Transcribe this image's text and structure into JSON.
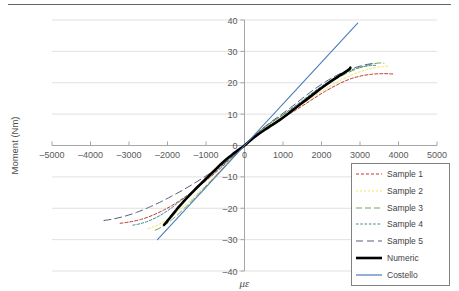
{
  "figure": {
    "has_top_rule": true
  },
  "chart_data": {
    "type": "line",
    "title": "",
    "xlabel": "με",
    "ylabel": "Moment (Nm)",
    "xlim": [
      -5000,
      5000
    ],
    "ylim": [
      -40,
      40
    ],
    "xticks": [
      -5000,
      -4000,
      -3000,
      -2000,
      -1000,
      0,
      1000,
      2000,
      3000,
      4000,
      5000
    ],
    "yticks": [
      40,
      30,
      20,
      10,
      0,
      -10,
      -20,
      -30,
      -40
    ],
    "xtick_labels": [
      "–5000",
      "–4000",
      "–3000",
      "–2000",
      "–1000",
      "0",
      "1000",
      "2000",
      "3000",
      "4000",
      "5000"
    ],
    "ytick_labels": [
      "40",
      "30",
      "20",
      "10",
      "0",
      "–10",
      "–20",
      "–30",
      "–40"
    ],
    "grid": "horizontal",
    "legend_position": "bottom-right",
    "series": [
      {
        "name": "Sample 1",
        "color": "#C0392B",
        "style": "dashed",
        "width": 1,
        "points": [
          [
            -3230,
            -24.8
          ],
          [
            -3000,
            -24.4
          ],
          [
            -2700,
            -23.6
          ],
          [
            -2400,
            -22.3
          ],
          [
            -2100,
            -20.6
          ],
          [
            -1800,
            -18.5
          ],
          [
            -1500,
            -16.0
          ],
          [
            -1200,
            -13.2
          ],
          [
            -900,
            -10.2
          ],
          [
            -600,
            -7.0
          ],
          [
            -300,
            -3.6
          ],
          [
            0,
            0
          ],
          [
            300,
            3.2
          ],
          [
            600,
            6.0
          ],
          [
            900,
            8.2
          ],
          [
            1200,
            10.3
          ],
          [
            1500,
            12.6
          ],
          [
            1800,
            15.0
          ],
          [
            2100,
            17.3
          ],
          [
            2400,
            19.3
          ],
          [
            2700,
            21.0
          ],
          [
            3000,
            22.1
          ],
          [
            3300,
            22.7
          ],
          [
            3600,
            22.9
          ],
          [
            3850,
            22.8
          ]
        ]
      },
      {
        "name": "Sample 2",
        "color": "#F2E55C",
        "style": "dotted",
        "width": 1,
        "points": [
          [
            -2500,
            -26.5
          ],
          [
            -2300,
            -25.6
          ],
          [
            -2100,
            -24.3
          ],
          [
            -1900,
            -22.6
          ],
          [
            -1700,
            -20.6
          ],
          [
            -1500,
            -18.5
          ],
          [
            -1300,
            -16.2
          ],
          [
            -1100,
            -13.9
          ],
          [
            -900,
            -11.4
          ],
          [
            -700,
            -8.9
          ],
          [
            -500,
            -6.3
          ],
          [
            -300,
            -3.7
          ],
          [
            0,
            0
          ],
          [
            300,
            3.4
          ],
          [
            600,
            6.3
          ],
          [
            900,
            8.6
          ],
          [
            1200,
            10.8
          ],
          [
            1500,
            13.2
          ],
          [
            1800,
            15.6
          ],
          [
            2100,
            18.0
          ],
          [
            2400,
            20.2
          ],
          [
            2700,
            22.0
          ],
          [
            3000,
            23.5
          ],
          [
            3300,
            24.6
          ],
          [
            3600,
            25.2
          ],
          [
            3730,
            25.3
          ]
        ]
      },
      {
        "name": "Sample 3",
        "color": "#6AA84F",
        "style": "dashed-long",
        "width": 1,
        "points": [
          [
            -2320,
            -27.0
          ],
          [
            -2150,
            -26.0
          ],
          [
            -1950,
            -24.3
          ],
          [
            -1750,
            -22.2
          ],
          [
            -1550,
            -19.9
          ],
          [
            -1350,
            -17.4
          ],
          [
            -1150,
            -14.9
          ],
          [
            -950,
            -12.3
          ],
          [
            -750,
            -9.7
          ],
          [
            -550,
            -7.1
          ],
          [
            -350,
            -4.5
          ],
          [
            -150,
            -1.9
          ],
          [
            0,
            0
          ],
          [
            250,
            3.0
          ],
          [
            550,
            6.2
          ],
          [
            850,
            8.6
          ],
          [
            1150,
            10.9
          ],
          [
            1450,
            13.4
          ],
          [
            1750,
            16.0
          ],
          [
            2050,
            18.6
          ],
          [
            2350,
            21.0
          ],
          [
            2650,
            23.0
          ],
          [
            2950,
            24.6
          ],
          [
            3250,
            25.8
          ],
          [
            3500,
            26.3
          ],
          [
            3620,
            26.2
          ]
        ]
      },
      {
        "name": "Sample 4",
        "color": "#3E8A95",
        "style": "dotted-dense",
        "width": 1,
        "points": [
          [
            -2900,
            -25.4
          ],
          [
            -2700,
            -24.9
          ],
          [
            -2500,
            -24.1
          ],
          [
            -2300,
            -23.0
          ],
          [
            -2100,
            -21.6
          ],
          [
            -1900,
            -19.9
          ],
          [
            -1700,
            -18.0
          ],
          [
            -1500,
            -16.1
          ],
          [
            -1300,
            -14.0
          ],
          [
            -1100,
            -11.9
          ],
          [
            -900,
            -9.8
          ],
          [
            -700,
            -7.7
          ],
          [
            -500,
            -5.5
          ],
          [
            -300,
            -3.3
          ],
          [
            0,
            0
          ],
          [
            300,
            3.5
          ],
          [
            600,
            6.5
          ],
          [
            900,
            9.0
          ],
          [
            1200,
            11.6
          ],
          [
            1500,
            14.3
          ],
          [
            1800,
            17.1
          ],
          [
            2100,
            19.7
          ],
          [
            2400,
            21.9
          ],
          [
            2700,
            23.7
          ],
          [
            3000,
            24.9
          ],
          [
            3300,
            25.5
          ],
          [
            3450,
            25.5
          ]
        ]
      },
      {
        "name": "Sample 5",
        "color": "#5B5D7A",
        "style": "dashed-wide",
        "width": 1,
        "points": [
          [
            -3650,
            -23.9
          ],
          [
            -3400,
            -23.4
          ],
          [
            -3100,
            -22.5
          ],
          [
            -2800,
            -21.3
          ],
          [
            -2500,
            -19.8
          ],
          [
            -2200,
            -18.1
          ],
          [
            -1900,
            -16.2
          ],
          [
            -1600,
            -14.2
          ],
          [
            -1300,
            -12.0
          ],
          [
            -1000,
            -9.7
          ],
          [
            -700,
            -7.2
          ],
          [
            -400,
            -4.5
          ],
          [
            -150,
            -2.0
          ],
          [
            0,
            0
          ],
          [
            300,
            3.6
          ],
          [
            600,
            6.7
          ],
          [
            900,
            9.4
          ],
          [
            1200,
            12.1
          ],
          [
            1500,
            15.0
          ],
          [
            1800,
            17.8
          ],
          [
            2100,
            20.3
          ],
          [
            2400,
            22.4
          ],
          [
            2700,
            24.1
          ],
          [
            3000,
            25.3
          ],
          [
            3250,
            26.0
          ],
          [
            3400,
            26.2
          ]
        ]
      },
      {
        "name": "Numeric",
        "color": "#000000",
        "style": "solid",
        "width": 2.6,
        "points": [
          [
            -2090,
            -25.3
          ],
          [
            -2000,
            -24.0
          ],
          [
            -1900,
            -22.5
          ],
          [
            -1800,
            -21.0
          ],
          [
            -1700,
            -19.5
          ],
          [
            -1600,
            -18.1
          ],
          [
            -1500,
            -16.8
          ],
          [
            -1400,
            -15.5
          ],
          [
            -1300,
            -14.2
          ],
          [
            -1200,
            -13.0
          ],
          [
            -1100,
            -11.8
          ],
          [
            -1000,
            -10.6
          ],
          [
            -900,
            -9.4
          ],
          [
            -800,
            -8.2
          ],
          [
            -700,
            -7.0
          ],
          [
            -600,
            -5.8
          ],
          [
            -500,
            -4.7
          ],
          [
            -400,
            -3.7
          ],
          [
            -300,
            -2.7
          ],
          [
            -200,
            -1.8
          ],
          [
            -100,
            -0.9
          ],
          [
            0,
            0
          ],
          [
            150,
            1.6
          ],
          [
            350,
            3.5
          ],
          [
            550,
            5.2
          ],
          [
            700,
            6.4
          ],
          [
            900,
            8.0
          ],
          [
            1100,
            9.8
          ],
          [
            1300,
            11.7
          ],
          [
            1500,
            13.6
          ],
          [
            1700,
            15.5
          ],
          [
            1900,
            17.4
          ],
          [
            2100,
            19.2
          ],
          [
            2300,
            20.9
          ],
          [
            2500,
            22.5
          ],
          [
            2700,
            24.1
          ],
          [
            2750,
            24.8
          ]
        ]
      },
      {
        "name": "Costello",
        "color": "#4A7EBB",
        "style": "solid",
        "width": 1.1,
        "points": [
          [
            -2260,
            -30.0
          ],
          [
            0,
            0
          ],
          [
            2940,
            39.0
          ]
        ]
      }
    ]
  },
  "legend": {
    "items": [
      {
        "label": "Sample 1"
      },
      {
        "label": "Sample 2"
      },
      {
        "label": "Sample 3"
      },
      {
        "label": "Sample 4"
      },
      {
        "label": "Sample 5"
      },
      {
        "label": "Numeric"
      },
      {
        "label": "Costello"
      }
    ]
  }
}
